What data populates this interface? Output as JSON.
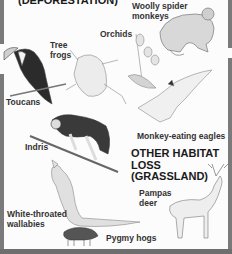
{
  "sections": {
    "deforestation_heading": "(DEFORESTATION)",
    "grassland_heading_line1": "OTHER HABITAT",
    "grassland_heading_line2": "LOSS",
    "grassland_heading_line3": "(GRASSLAND)"
  },
  "species": {
    "woolly_spider_monkeys": [
      "Woolly spider",
      "monkeys"
    ],
    "tree_frogs": [
      "Tree",
      "frogs"
    ],
    "orchids": "Orchids",
    "toucans": "Toucans",
    "monkey_eating_eagles": "Monkey-eating eagles",
    "indris": "Indris",
    "pampas_deer": [
      "Pampas",
      "deer"
    ],
    "white_throated_wallabies": [
      "White-throated",
      "wallabies"
    ],
    "pygmy_hogs": "Pygmy hogs"
  },
  "colors": {
    "border": "#7a7a7a",
    "text": "#1a1a1a",
    "background": "#fcfcfc"
  }
}
